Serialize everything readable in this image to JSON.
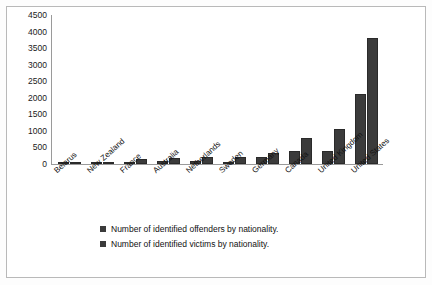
{
  "chart_data": {
    "type": "bar",
    "title": "",
    "subtitle": "",
    "xlabel": "",
    "ylabel": "",
    "ylim": [
      0,
      4500
    ],
    "yticks": [
      4500,
      4000,
      3500,
      3000,
      2500,
      2000,
      1500,
      1000,
      500,
      0
    ],
    "grid": false,
    "legend_position": "bottom",
    "categories": [
      "Belarus",
      "New Zealand",
      "France",
      "Australia",
      "Netherlands",
      "Sweden",
      "Germany",
      "Canada",
      "United Kingdom",
      "United States"
    ],
    "series": [
      {
        "name": "Number of identified offenders by nationality.",
        "color": "#3b3b3b",
        "values": [
          60,
          30,
          70,
          80,
          90,
          50,
          200,
          400,
          380,
          2100
        ]
      },
      {
        "name": "Number of identified victims by nationality.",
        "color": "#3b3b3b",
        "values": [
          0,
          40,
          150,
          170,
          220,
          200,
          320,
          800,
          1050,
          3800
        ]
      }
    ]
  },
  "legend": {
    "items": [
      {
        "label": "Number of identified offenders by nationality."
      },
      {
        "label": "Number of identified victims by nationality."
      }
    ]
  },
  "colors": {
    "bar": "#3b3b3b",
    "axis": "#9a9a9a",
    "frame": "#b9b9b9",
    "text": "#111111"
  }
}
